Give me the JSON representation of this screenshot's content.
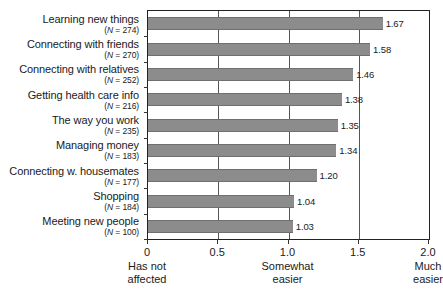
{
  "chart_data": {
    "type": "bar",
    "orientation": "horizontal",
    "title": "",
    "xlabel": "",
    "ylabel": "",
    "xlim": [
      0,
      2.0
    ],
    "grid": true,
    "legend": null,
    "xticks": [
      {
        "value": 0,
        "label": "0",
        "sub": "Has not\naffected"
      },
      {
        "value": 0.5,
        "label": "0.5",
        "sub": ""
      },
      {
        "value": 1.0,
        "label": "1.0",
        "sub": "Somewhat\neasier"
      },
      {
        "value": 1.5,
        "label": "1.5",
        "sub": ""
      },
      {
        "value": 2.0,
        "label": "2.0",
        "sub": "Much\neasier"
      }
    ],
    "categories": [
      "Learning new things",
      "Connecting with friends",
      "Connecting with relatives",
      "Getting health care info",
      "The way you work",
      "Managing money",
      "Connecting w. housemates",
      "Shopping",
      "Meeting new people"
    ],
    "n_labels": [
      "(N = 274)",
      "(N = 270)",
      "(N = 252)",
      "(N = 216)",
      "(N = 235)",
      "(N = 183)",
      "(N = 177)",
      "(N = 184)",
      "(N = 100)"
    ],
    "values": [
      1.67,
      1.58,
      1.46,
      1.38,
      1.35,
      1.34,
      1.2,
      1.04,
      1.03
    ],
    "value_labels": [
      "1.67",
      "1.58",
      "1.46",
      "1.38",
      "1.35",
      "1.34",
      "1.20",
      "1.04",
      "1.03"
    ],
    "bar_color": "#8c8c8c",
    "axis_color": "#222222",
    "grid_color": "#555555",
    "background": "#ffffff"
  }
}
